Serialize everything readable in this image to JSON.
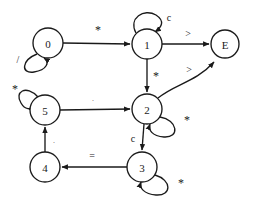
{
  "diagram": {
    "type": "state-machine",
    "background_color": "#ffffff",
    "stroke_color": "#1a1a1a",
    "states": [
      {
        "id": "s0",
        "label": "0",
        "cx": 48,
        "cy": 43,
        "r": 15
      },
      {
        "id": "s1",
        "label": "1",
        "cx": 147,
        "cy": 44,
        "r": 15
      },
      {
        "id": "sE",
        "label": "E",
        "cx": 225,
        "cy": 44,
        "r": 14
      },
      {
        "id": "s2",
        "label": "2",
        "cx": 147,
        "cy": 109,
        "r": 15
      },
      {
        "id": "s5",
        "label": "5",
        "cx": 45,
        "cy": 110,
        "r": 15
      },
      {
        "id": "s4",
        "label": "4",
        "cx": 45,
        "cy": 167,
        "r": 15
      },
      {
        "id": "s3",
        "label": "3",
        "cx": 142,
        "cy": 167,
        "r": 15
      }
    ],
    "transitions": [
      {
        "id": "t0-1",
        "from": "0",
        "to": "1",
        "label": "*",
        "label_x": 98,
        "label_y": 30,
        "kind": "straight"
      },
      {
        "id": "t1-E",
        "from": "1",
        "to": "E",
        "label": ">",
        "label_x": 188,
        "label_y": 33,
        "kind": "straight"
      },
      {
        "id": "t1-2",
        "from": "1",
        "to": "2",
        "label": "*",
        "label_x": 155,
        "label_y": 76,
        "kind": "straight"
      },
      {
        "id": "t2-E",
        "from": "2",
        "to": "E",
        "label": ">",
        "label_x": 189,
        "label_y": 70,
        "kind": "curved"
      },
      {
        "id": "t5-2",
        "from": "5",
        "to": "2",
        "label": ".",
        "label_x": 93,
        "label_y": 98,
        "kind": "straight",
        "faint": true
      },
      {
        "id": "t2-3",
        "from": "2",
        "to": "3",
        "label": "c",
        "label_x": 133,
        "label_y": 138,
        "kind": "straight"
      },
      {
        "id": "t3-4",
        "from": "3",
        "to": "4",
        "label": "=",
        "label_x": 92,
        "label_y": 155,
        "kind": "straight"
      },
      {
        "id": "t4-5",
        "from": "4",
        "to": "5",
        "label": ".",
        "label_x": 54,
        "label_y": 140,
        "kind": "straight",
        "faint": true
      }
    ],
    "self_loops": [
      {
        "id": "l0",
        "state": "0",
        "label": "/",
        "label_x": 18,
        "label_y": 58,
        "position": "lower-left"
      },
      {
        "id": "l1",
        "state": "1",
        "label": "c",
        "label_x": 168,
        "label_y": 18,
        "position": "top"
      },
      {
        "id": "l5",
        "state": "5",
        "label": "*",
        "label_x": 16,
        "label_y": 90,
        "position": "upper-left"
      },
      {
        "id": "l2",
        "state": "2",
        "label": "*",
        "label_x": 186,
        "label_y": 120,
        "position": "lower-right"
      },
      {
        "id": "l3",
        "state": "3",
        "label": "*",
        "label_x": 180,
        "label_y": 183,
        "position": "lower-right"
      }
    ]
  }
}
